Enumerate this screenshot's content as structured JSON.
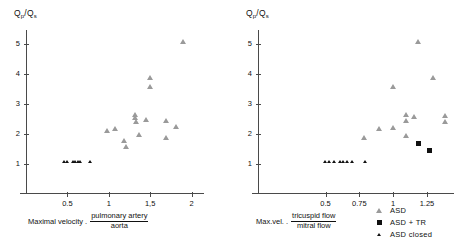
{
  "figure": {
    "panels": [
      {
        "id": "left",
        "ylabel_main": "Q",
        "ylabel_sub1": "p",
        "ylabel_slash": "/Q",
        "ylabel_sub2": "s",
        "xcaption_lead": "Maximal velocity .",
        "xcaption_numerator": "pulmonary artery",
        "xcaption_denominator": "aorta"
      },
      {
        "id": "right",
        "ylabel_main": "Q",
        "ylabel_sub1": "p",
        "ylabel_slash": "/Q",
        "ylabel_sub2": "s",
        "xcaption_lead": "Max.vel. .",
        "xcaption_numerator": "tricuspid flow",
        "xcaption_denominator": "mitral flow"
      }
    ],
    "legend": {
      "items": [
        {
          "label": "ASD",
          "marker": "open-triangle"
        },
        {
          "label": "ASD + TR",
          "marker": "filled-square"
        },
        {
          "label": "ASD closed",
          "marker": "small-filled-triangle"
        }
      ]
    }
  },
  "chart_data": [
    {
      "type": "scatter",
      "title": "",
      "xlabel": "Maximal velocity . pulmonary artery / aorta",
      "ylabel": "Qp/Qs",
      "xlim": [
        0,
        2.15
      ],
      "ylim": [
        0,
        5.45
      ],
      "xticks": [
        0.5,
        1,
        1.5,
        2
      ],
      "xtick_labels": [
        "0.5",
        "1",
        "1,5",
        "2"
      ],
      "yticks": [
        1,
        2,
        3,
        4,
        5
      ],
      "ytick_labels": [
        "1",
        "2",
        "3",
        "4",
        "5"
      ],
      "grid": false,
      "legend_position": "none",
      "series": [
        {
          "name": "ASD",
          "marker": "open-triangle",
          "color": "#9a9a9a",
          "points": [
            [
              0.98,
              2.0
            ],
            [
              1.08,
              2.08
            ],
            [
              1.19,
              1.68
            ],
            [
              1.21,
              1.48
            ],
            [
              1.32,
              2.55
            ],
            [
              1.32,
              2.44
            ],
            [
              1.33,
              2.3
            ],
            [
              1.37,
              1.88
            ],
            [
              1.45,
              2.37
            ],
            [
              1.5,
              3.78
            ],
            [
              1.5,
              3.48
            ],
            [
              1.69,
              2.35
            ],
            [
              1.7,
              1.78
            ],
            [
              1.82,
              2.15
            ],
            [
              1.9,
              4.98
            ]
          ]
        },
        {
          "name": "ASD + TR",
          "marker": "filled-square",
          "color": "#111111",
          "points": []
        },
        {
          "name": "ASD closed",
          "marker": "small-filled-triangle",
          "color": "#111111",
          "points": [
            [
              0.46,
              1.0
            ],
            [
              0.5,
              1.0
            ],
            [
              0.57,
              1.0
            ],
            [
              0.6,
              1.0
            ],
            [
              0.63,
              1.0
            ],
            [
              0.66,
              1.0
            ],
            [
              0.78,
              1.0
            ]
          ]
        }
      ]
    },
    {
      "type": "scatter",
      "title": "",
      "xlabel": "Max.vel. . tricuspid flow / mitral flow",
      "ylabel": "Qp/Qs",
      "xlim": [
        0,
        1.45
      ],
      "ylim": [
        0,
        5.45
      ],
      "xticks": [
        0.5,
        0.75,
        1,
        1.25
      ],
      "xtick_labels": [
        "0.5",
        "0.75",
        "1",
        "1.25"
      ],
      "yticks": [
        1,
        2,
        3,
        4,
        5
      ],
      "ytick_labels": [
        "1",
        "2",
        "3",
        "4",
        "5"
      ],
      "grid": false,
      "legend_position": "bottom-right",
      "series": [
        {
          "name": "ASD",
          "marker": "open-triangle",
          "color": "#9a9a9a",
          "points": [
            [
              0.79,
              1.78
            ],
            [
              0.9,
              2.08
            ],
            [
              1.0,
              2.1
            ],
            [
              1.0,
              3.48
            ],
            [
              1.1,
              2.55
            ],
            [
              1.1,
              2.35
            ],
            [
              1.1,
              1.85
            ],
            [
              1.16,
              2.48
            ],
            [
              1.19,
              4.98
            ],
            [
              1.3,
              3.78
            ],
            [
              1.39,
              2.52
            ],
            [
              1.39,
              2.3
            ]
          ]
        },
        {
          "name": "ASD + TR",
          "marker": "filled-square",
          "color": "#111111",
          "points": [
            [
              1.19,
              1.68
            ],
            [
              1.27,
              1.45
            ]
          ]
        },
        {
          "name": "ASD closed",
          "marker": "small-filled-triangle",
          "color": "#111111",
          "points": [
            [
              0.5,
              1.0
            ],
            [
              0.53,
              1.0
            ],
            [
              0.56,
              1.0
            ],
            [
              0.61,
              1.0
            ],
            [
              0.63,
              1.0
            ],
            [
              0.66,
              1.0
            ],
            [
              0.7,
              1.0
            ],
            [
              0.79,
              1.0
            ]
          ]
        }
      ]
    }
  ]
}
